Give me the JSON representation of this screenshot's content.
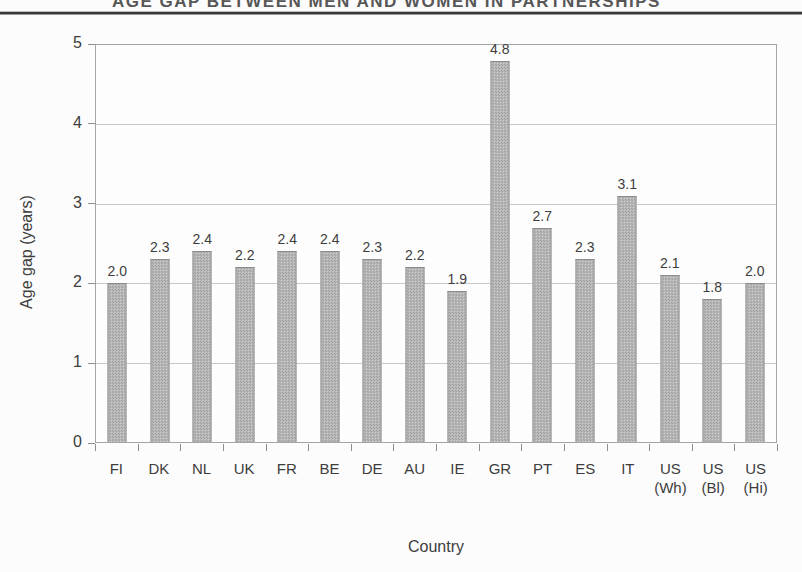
{
  "page": {
    "clipped_header": "AGE GAP BETWEEN MEN AND WOMEN IN PARTNERSHIPS"
  },
  "chart_data": {
    "type": "bar",
    "title": "AGE GAP BETWEEN MEN AND WOMEN IN PARTNERSHIPS",
    "xlabel": "Country",
    "ylabel": "Age gap (years)",
    "ylim": [
      0,
      5
    ],
    "ytick_step": 1,
    "grid": true,
    "legend_position": "none",
    "categories": [
      {
        "line1": "FI",
        "line2": ""
      },
      {
        "line1": "DK",
        "line2": ""
      },
      {
        "line1": "NL",
        "line2": ""
      },
      {
        "line1": "UK",
        "line2": ""
      },
      {
        "line1": "FR",
        "line2": ""
      },
      {
        "line1": "BE",
        "line2": ""
      },
      {
        "line1": "DE",
        "line2": ""
      },
      {
        "line1": "AU",
        "line2": ""
      },
      {
        "line1": "IE",
        "line2": ""
      },
      {
        "line1": "GR",
        "line2": ""
      },
      {
        "line1": "PT",
        "line2": ""
      },
      {
        "line1": "ES",
        "line2": ""
      },
      {
        "line1": "IT",
        "line2": ""
      },
      {
        "line1": "US",
        "line2": "(Wh)"
      },
      {
        "line1": "US",
        "line2": "(Bl)"
      },
      {
        "line1": "US",
        "line2": "(Hi)"
      }
    ],
    "values": [
      2.0,
      2.3,
      2.4,
      2.2,
      2.4,
      2.4,
      2.3,
      2.2,
      1.9,
      4.8,
      2.7,
      2.3,
      3.1,
      2.1,
      1.8,
      2.0
    ],
    "colors": {
      "bar_fill_light": "#cecece",
      "bar_fill_dot": "#9f9f9f",
      "bar_border": "#8c8c8c",
      "gridline": "#c9c9c9",
      "axis": "#a5a5a5",
      "text": "#3d3d3d"
    }
  }
}
